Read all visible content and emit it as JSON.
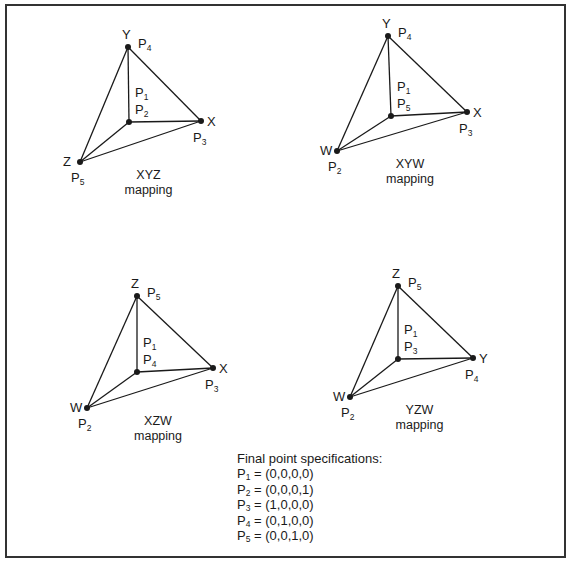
{
  "figure": {
    "panels": [
      {
        "id": "xyz",
        "caption_line1": "XYZ",
        "caption_line2": "mapping",
        "vertices": {
          "top": {
            "axis": "Y",
            "point": "P",
            "sub": "4",
            "x": 128,
            "y": 47
          },
          "center": {
            "axis": "",
            "point": "P",
            "sub": "2",
            "x": 129,
            "y": 122
          },
          "right": {
            "axis": "X",
            "point": "P",
            "sub": "3",
            "x": 201,
            "y": 121
          },
          "left": {
            "axis": "Z",
            "point": "P",
            "sub": "5",
            "x": 80,
            "y": 162
          }
        },
        "p1_label": {
          "point": "P",
          "sub": "1"
        }
      },
      {
        "id": "xyw",
        "caption_line1": "XYW",
        "caption_line2": "mapping",
        "vertices": {
          "top": {
            "axis": "Y",
            "point": "P",
            "sub": "4",
            "x": 388,
            "y": 36
          },
          "center": {
            "axis": "",
            "point": "P",
            "sub": "5",
            "x": 391,
            "y": 116
          },
          "right": {
            "axis": "X",
            "point": "P",
            "sub": "3",
            "x": 467,
            "y": 112
          },
          "left": {
            "axis": "W",
            "point": "P",
            "sub": "2",
            "x": 337,
            "y": 151
          }
        },
        "p1_label": {
          "point": "P",
          "sub": "1"
        }
      },
      {
        "id": "xzw",
        "caption_line1": "XZW",
        "caption_line2": "mapping",
        "vertices": {
          "top": {
            "axis": "Z",
            "point": "P",
            "sub": "5",
            "x": 137,
            "y": 296
          },
          "center": {
            "axis": "",
            "point": "P",
            "sub": "4",
            "x": 137,
            "y": 372
          },
          "right": {
            "axis": "X",
            "point": "P",
            "sub": "3",
            "x": 213,
            "y": 368
          },
          "left": {
            "axis": "W",
            "point": "P",
            "sub": "2",
            "x": 87,
            "y": 408
          }
        },
        "p1_label": {
          "point": "P",
          "sub": "1"
        }
      },
      {
        "id": "yzw",
        "caption_line1": "YZW",
        "caption_line2": "mapping",
        "vertices": {
          "top": {
            "axis": "Z",
            "point": "P",
            "sub": "5",
            "x": 398,
            "y": 286
          },
          "center": {
            "axis": "",
            "point": "P",
            "sub": "3",
            "x": 398,
            "y": 359
          },
          "right": {
            "axis": "Y",
            "point": "P",
            "sub": "4",
            "x": 473,
            "y": 358
          },
          "left": {
            "axis": "W",
            "point": "P",
            "sub": "2",
            "x": 350,
            "y": 397
          }
        },
        "p1_label": {
          "point": "P",
          "sub": "1"
        }
      }
    ],
    "specs": {
      "title": "Final point specifications:",
      "rows": [
        {
          "point": "P",
          "sub": "1",
          "value": "= (0,0,0,0)"
        },
        {
          "point": "P",
          "sub": "2",
          "value": "= (0,0,0,1)"
        },
        {
          "point": "P",
          "sub": "3",
          "value": "= (1,0,0,0)"
        },
        {
          "point": "P",
          "sub": "4",
          "value": "= (0,1,0,0)"
        },
        {
          "point": "P",
          "sub": "5",
          "value": "= (0,0,1,0)"
        }
      ]
    },
    "colors": {
      "line": "#1a1a1a",
      "border": "#333333",
      "background": "#ffffff"
    }
  }
}
